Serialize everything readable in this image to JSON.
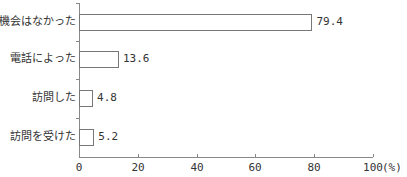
{
  "chart_data": {
    "type": "bar",
    "orientation": "horizontal",
    "title": "",
    "xlabel": "",
    "ylabel": "",
    "unit": "(%)",
    "categories": [
      "機会はなかった",
      "電話によった",
      "訪問した",
      "訪問を受けた"
    ],
    "values": [
      79.4,
      13.6,
      4.8,
      5.2
    ],
    "value_labels": [
      "79.4",
      "13.6",
      "4.8",
      "5.2"
    ],
    "xlim": [
      0,
      100
    ],
    "xticks": [
      "0",
      "20",
      "40",
      "60",
      "80",
      "100"
    ],
    "grid": false,
    "legend": null,
    "bar_fill": "#ffffff",
    "bar_stroke": "#777777"
  }
}
